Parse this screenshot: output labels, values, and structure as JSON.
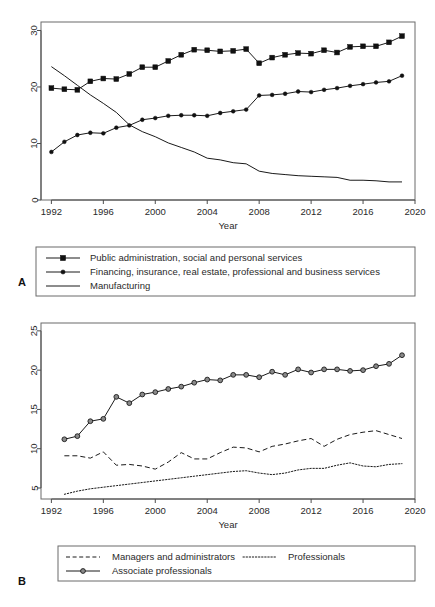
{
  "figure": {
    "panels": [
      {
        "letter": "A",
        "xlabel": "Year",
        "ylabel": "",
        "xticks": [
          1992,
          1996,
          2000,
          2004,
          2008,
          2012,
          2016,
          2020
        ],
        "yticks": [
          0,
          10,
          20,
          30
        ],
        "xlim": [
          1991.2,
          2020.0
        ],
        "ylim": [
          0,
          31.5
        ],
        "legend_entries": [
          {
            "label": "Public administration, social and personal services",
            "style": "line-square"
          },
          {
            "label": "Financing, insurance, real estate, professional and business services",
            "style": "line-dot"
          },
          {
            "label": "Manufacturing",
            "style": "line-plain"
          }
        ]
      },
      {
        "letter": "B",
        "xlabel": "Year",
        "ylabel": "",
        "xticks": [
          1992,
          1996,
          2000,
          2004,
          2008,
          2012,
          2016,
          2020
        ],
        "yticks": [
          5,
          10,
          15,
          20,
          25
        ],
        "xlim": [
          1991.2,
          2020.0
        ],
        "ylim": [
          3.6,
          26.0
        ],
        "legend_entries": [
          {
            "label": "Managers and administrators",
            "style": "dashed"
          },
          {
            "label": "Professionals",
            "style": "dotted"
          },
          {
            "label": "Associate professionals",
            "style": "line-circle"
          }
        ]
      }
    ]
  },
  "chart_data": [
    {
      "type": "line",
      "panel": "A",
      "title": "",
      "xlabel": "Year",
      "ylabel": "",
      "xlim": [
        1991.2,
        2020.0
      ],
      "ylim": [
        0,
        31.5
      ],
      "xticks": [
        1992,
        1996,
        2000,
        2004,
        2008,
        2012,
        2016,
        2020
      ],
      "yticks": [
        0,
        10,
        20,
        30
      ],
      "grid": false,
      "legend_position": "below-plot",
      "x": [
        1992,
        1993,
        1994,
        1995,
        1996,
        1997,
        1998,
        1999,
        2000,
        2001,
        2002,
        2003,
        2004,
        2005,
        2006,
        2007,
        2008,
        2009,
        2010,
        2011,
        2012,
        2013,
        2014,
        2015,
        2016,
        2017,
        2018,
        2019
      ],
      "series": [
        {
          "name": "Public administration, social and personal services",
          "marker": "square",
          "linestyle": "solid",
          "values": [
            19.8,
            19.6,
            19.5,
            21.0,
            21.5,
            21.4,
            22.3,
            23.5,
            23.5,
            24.6,
            25.7,
            26.6,
            26.5,
            26.3,
            26.4,
            26.7,
            24.2,
            25.2,
            25.7,
            26.0,
            25.9,
            26.5,
            26.1,
            27.1,
            27.2,
            27.2,
            27.9,
            29.0
          ]
        },
        {
          "name": "Financing, insurance, real estate, professional and business services",
          "marker": "dot",
          "linestyle": "solid",
          "values": [
            8.5,
            10.3,
            11.5,
            11.9,
            11.8,
            12.8,
            13.2,
            14.2,
            14.5,
            14.9,
            15.0,
            15.0,
            14.9,
            15.4,
            15.7,
            16.0,
            18.5,
            18.6,
            18.8,
            19.2,
            19.1,
            19.5,
            19.8,
            20.2,
            20.5,
            20.8,
            21.0,
            22.0
          ]
        },
        {
          "name": "Manufacturing",
          "marker": "none",
          "linestyle": "solid",
          "values": [
            23.6,
            22.0,
            20.3,
            18.6,
            17.1,
            15.5,
            13.3,
            12.1,
            11.2,
            10.1,
            9.3,
            8.5,
            7.4,
            7.1,
            6.6,
            6.4,
            5.1,
            4.7,
            4.5,
            4.3,
            4.2,
            4.1,
            4.0,
            3.5,
            3.5,
            3.4,
            3.2,
            3.2
          ]
        }
      ]
    },
    {
      "type": "line",
      "panel": "B",
      "title": "",
      "xlabel": "Year",
      "ylabel": "",
      "xlim": [
        1991.2,
        2020.0
      ],
      "ylim": [
        3.6,
        26.0
      ],
      "xticks": [
        1992,
        1996,
        2000,
        2004,
        2008,
        2012,
        2016,
        2020
      ],
      "yticks": [
        5,
        10,
        15,
        20,
        25
      ],
      "grid": false,
      "legend_position": "below-plot",
      "x": [
        1993,
        1994,
        1995,
        1996,
        1997,
        1998,
        1999,
        2000,
        2001,
        2002,
        2003,
        2004,
        2005,
        2006,
        2007,
        2008,
        2009,
        2010,
        2011,
        2012,
        2013,
        2014,
        2015,
        2016,
        2017,
        2018,
        2019
      ],
      "series": [
        {
          "name": "Managers and administrators",
          "marker": "none",
          "linestyle": "dashed",
          "values": [
            9.1,
            9.1,
            8.8,
            9.6,
            7.9,
            8.0,
            7.8,
            7.4,
            8.3,
            9.5,
            8.7,
            8.7,
            9.5,
            10.2,
            10.1,
            9.6,
            10.3,
            10.6,
            11.0,
            11.3,
            10.3,
            11.2,
            11.8,
            12.1,
            12.3,
            11.8,
            11.3
          ]
        },
        {
          "name": "Professionals",
          "marker": "none",
          "linestyle": "dotted",
          "values": [
            4.2,
            4.6,
            4.9,
            5.1,
            5.3,
            5.5,
            5.7,
            5.9,
            6.1,
            6.3,
            6.5,
            6.7,
            6.9,
            7.1,
            7.2,
            6.9,
            6.7,
            6.9,
            7.3,
            7.5,
            7.5,
            7.9,
            8.2,
            7.8,
            7.7,
            8.0,
            8.1
          ]
        },
        {
          "name": "Associate professionals",
          "marker": "circle",
          "linestyle": "solid",
          "values": [
            11.2,
            11.6,
            13.5,
            13.8,
            16.6,
            15.8,
            16.9,
            17.2,
            17.6,
            17.9,
            18.4,
            18.8,
            18.7,
            19.4,
            19.4,
            19.1,
            19.8,
            19.4,
            20.1,
            19.7,
            20.1,
            20.1,
            19.9,
            20.0,
            20.5,
            20.8,
            21.9
          ]
        }
      ]
    }
  ]
}
